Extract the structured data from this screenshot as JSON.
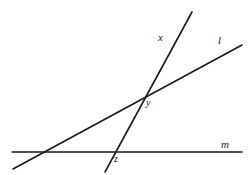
{
  "figure": {
    "type": "geometry-diagram",
    "background_color": "#ffffff",
    "stroke_color": "#1a1a1a",
    "stroke_width": 1.6,
    "width": 252,
    "height": 175,
    "lines": [
      {
        "id": "line-m",
        "label": "m",
        "label_position": {
          "x": 221,
          "y": 139
        },
        "x1": 12,
        "y1": 152,
        "x2": 242,
        "y2": 152,
        "orientation": "horizontal"
      },
      {
        "id": "line-l",
        "label": "l",
        "label_position": {
          "x": 218,
          "y": 35
        },
        "x1": 13,
        "y1": 169,
        "x2": 242,
        "y2": 45,
        "orientation": "shallow-diagonal"
      },
      {
        "id": "line-x",
        "label": "x",
        "label_position": {
          "x": 158,
          "y": 32
        },
        "x1": 105,
        "y1": 172,
        "x2": 192,
        "y2": 12,
        "orientation": "steep-diagonal"
      }
    ],
    "points": [
      {
        "id": "point-y",
        "label": "y",
        "x": 143,
        "y": 98,
        "label_position": {
          "x": 146,
          "y": 98
        },
        "intersection_of": [
          "line-x",
          "line-l"
        ]
      },
      {
        "id": "point-z",
        "label": "z",
        "x": 110,
        "y": 153,
        "label_position": {
          "x": 114,
          "y": 154
        },
        "intersection_of": [
          "line-x",
          "line-m"
        ]
      }
    ]
  }
}
